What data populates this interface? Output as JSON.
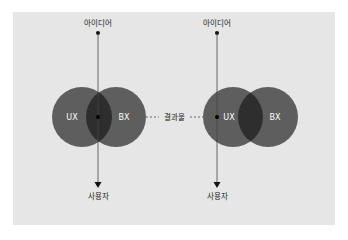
{
  "colors": {
    "background": "#ffffff",
    "panel": "#e6e6e6",
    "circle": "#5e5e5e",
    "intersection": "#2e2e2e",
    "line": "#444444",
    "text": "#222222"
  },
  "left_diagram": {
    "top_label": "아이디어",
    "bottom_label": "사용자",
    "circle_left_label": "UX",
    "circle_right_label": "BX"
  },
  "connector": {
    "label": "결과물"
  },
  "right_diagram": {
    "top_label": "아이디어",
    "bottom_label": "사용자",
    "circle_left_label": "UX",
    "circle_right_label": "BX"
  }
}
